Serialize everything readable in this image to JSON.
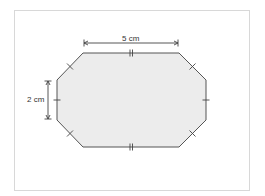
{
  "diagram": {
    "type": "geometry-figure",
    "shape": "octagon",
    "fill_color": "#ececec",
    "stroke_color": "#555555",
    "frame_border_color": "#d8d8d8",
    "dimensions": {
      "top_width_label": "5 cm",
      "left_height_label": "2 cm"
    },
    "tick_marks": {
      "top_and_bottom_edges": "double tick (equal length)",
      "diagonal_edges": "single cross tick (equal length)",
      "left_and_right_edges": "single tick (equal length)"
    }
  }
}
